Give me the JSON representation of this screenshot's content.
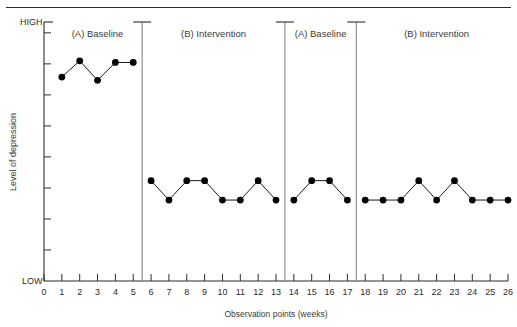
{
  "figure": {
    "name": "ABAB reversal design depression graph"
  },
  "chart_data": {
    "type": "line",
    "title": "",
    "xlabel": "Observation points (weeks)",
    "ylabel": "Level of depression",
    "y_axis_high_label": "HIGH",
    "y_axis_low_label": "LOW",
    "ylim": [
      0,
      8
    ],
    "y_tick_count": 8,
    "xlim": [
      0,
      26
    ],
    "grid": false,
    "legend": "none",
    "x_tick_labels": [
      "0",
      "1",
      "2",
      "3",
      "4",
      "5",
      "6",
      "7",
      "8",
      "9",
      "10",
      "11",
      "12",
      "13",
      "14",
      "15",
      "16",
      "17",
      "18",
      "19",
      "20",
      "21",
      "22",
      "23",
      "24",
      "25",
      "26"
    ],
    "marker": "filled-circle",
    "line_color": "#1a1a1a",
    "marker_color": "#000000",
    "phases": [
      {
        "label": "(A) Baseline",
        "start": 1,
        "end": 5,
        "divider_after": 5.5
      },
      {
        "label": "(B) Intervention",
        "start": 6,
        "end": 13,
        "divider_after": 13.5
      },
      {
        "label": "(A) Baseline",
        "start": 14,
        "end": 17,
        "divider_after": 17.5
      },
      {
        "label": "(B) Intervention",
        "start": 18,
        "end": 26,
        "divider_after": null
      }
    ],
    "x": [
      1,
      2,
      3,
      4,
      5,
      6,
      7,
      8,
      9,
      10,
      11,
      12,
      13,
      14,
      15,
      16,
      17,
      18,
      19,
      20,
      21,
      22,
      23,
      24,
      25,
      26
    ],
    "values": [
      6.3,
      6.8,
      6.2,
      6.75,
      6.75,
      3.1,
      2.5,
      3.1,
      3.1,
      2.5,
      2.5,
      3.1,
      2.5,
      2.5,
      3.1,
      3.1,
      2.5,
      2.5,
      2.5,
      2.5,
      3.1,
      2.5,
      3.1,
      2.5,
      2.5,
      2.5
    ],
    "series": [
      {
        "name": "Level of depression",
        "values": [
          6.3,
          6.8,
          6.2,
          6.75,
          6.75,
          3.1,
          2.5,
          3.1,
          3.1,
          2.5,
          2.5,
          3.1,
          2.5,
          2.5,
          3.1,
          3.1,
          2.5,
          2.5,
          2.5,
          2.5,
          3.1,
          2.5,
          3.1,
          2.5,
          2.5,
          2.5
        ]
      }
    ]
  }
}
